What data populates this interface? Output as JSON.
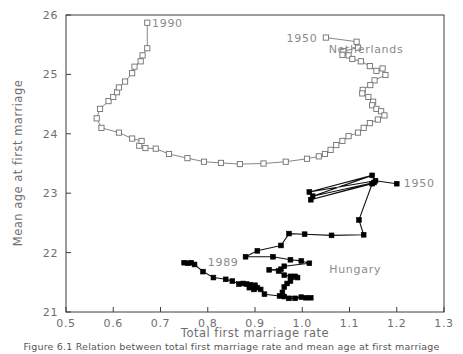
{
  "figure": {
    "caption": "Figure 6.1  Relation between total first marriage rate and mean age at first marriage"
  },
  "chart_data": {
    "type": "scatter",
    "title": "",
    "xlabel": "Total first marriage rate",
    "ylabel": "Mean age at first marriage",
    "xlim": [
      0.5,
      1.3
    ],
    "ylim": [
      21,
      26
    ],
    "xticks": [
      0.5,
      0.6,
      0.7,
      0.8,
      0.9,
      1.0,
      1.1,
      1.2,
      1.3
    ],
    "xtick_labels": [
      "0.5",
      "0.6",
      "0.7",
      "0.8",
      "0.9",
      "1.0",
      "1.1",
      "1.2",
      "1.3"
    ],
    "yticks": [
      21,
      22,
      23,
      24,
      25,
      26
    ],
    "ytick_labels": [
      "21",
      "22",
      "23",
      "24",
      "25",
      "26"
    ],
    "grid": false,
    "legend": "none",
    "connected": true,
    "annotations": [
      {
        "text": "1990",
        "x": 0.682,
        "y": 25.87,
        "anchor": "start",
        "series": "Netherlands"
      },
      {
        "text": "1950",
        "x": 1.032,
        "y": 25.62,
        "anchor": "end",
        "series": "Netherlands"
      },
      {
        "text": "Netherlands",
        "x": 1.135,
        "y": 25.42,
        "anchor": "middle",
        "series": "Netherlands"
      },
      {
        "text": "1950",
        "x": 1.215,
        "y": 23.18,
        "anchor": "start",
        "series": "Hungary"
      },
      {
        "text": "1989",
        "x": 0.8,
        "y": 21.84,
        "anchor": "start",
        "series": "Hungary"
      },
      {
        "text": "Hungary",
        "x": 1.112,
        "y": 21.73,
        "anchor": "middle",
        "series": "Hungary"
      }
    ],
    "series": [
      {
        "name": "Netherlands",
        "marker": "open-square",
        "color": "#6f6f6f",
        "start_label": "1950",
        "end_label": "1990",
        "points": [
          [
            1.05,
            25.62
          ],
          [
            1.115,
            25.55
          ],
          [
            1.118,
            25.45
          ],
          [
            1.087,
            25.39
          ],
          [
            1.085,
            25.33
          ],
          [
            1.098,
            25.32
          ],
          [
            1.106,
            25.26
          ],
          [
            1.124,
            25.22
          ],
          [
            1.143,
            25.14
          ],
          [
            1.157,
            25.06
          ],
          [
            1.17,
            25.1
          ],
          [
            1.176,
            24.99
          ],
          [
            1.153,
            24.9
          ],
          [
            1.144,
            24.82
          ],
          [
            1.128,
            24.74
          ],
          [
            1.127,
            24.68
          ],
          [
            1.14,
            24.62
          ],
          [
            1.15,
            24.54
          ],
          [
            1.148,
            24.48
          ],
          [
            1.157,
            24.42
          ],
          [
            1.167,
            24.38
          ],
          [
            1.174,
            24.31
          ],
          [
            1.16,
            24.24
          ],
          [
            1.143,
            24.18
          ],
          [
            1.13,
            24.1
          ],
          [
            1.118,
            24.02
          ],
          [
            1.098,
            23.96
          ],
          [
            1.085,
            23.88
          ],
          [
            1.072,
            23.81
          ],
          [
            1.06,
            23.73
          ],
          [
            1.048,
            23.66
          ],
          [
            1.035,
            23.62
          ],
          [
            1.01,
            23.58
          ],
          [
            0.965,
            23.53
          ],
          [
            0.918,
            23.5
          ],
          [
            0.868,
            23.49
          ],
          [
            0.828,
            23.51
          ],
          [
            0.792,
            23.53
          ],
          [
            0.757,
            23.59
          ],
          [
            0.718,
            23.66
          ],
          [
            0.69,
            23.75
          ],
          [
            0.668,
            23.76
          ],
          [
            0.655,
            23.8
          ],
          [
            0.66,
            23.88
          ],
          [
            0.64,
            23.92
          ],
          [
            0.612,
            24.02
          ],
          [
            0.575,
            24.1
          ],
          [
            0.565,
            24.26
          ],
          [
            0.572,
            24.42
          ],
          [
            0.59,
            24.55
          ],
          [
            0.6,
            24.62
          ],
          [
            0.608,
            24.7
          ],
          [
            0.612,
            24.78
          ],
          [
            0.625,
            24.88
          ],
          [
            0.64,
            25.02
          ],
          [
            0.645,
            25.13
          ],
          [
            0.658,
            25.22
          ],
          [
            0.662,
            25.32
          ],
          [
            0.672,
            25.44
          ],
          [
            0.672,
            25.87
          ]
        ]
      },
      {
        "name": "Hungary",
        "marker": "filled-square",
        "color": "#000000",
        "start_label": "1950",
        "end_label": "1989",
        "points": [
          [
            1.2,
            23.16
          ],
          [
            1.155,
            23.21
          ],
          [
            1.015,
            23.02
          ],
          [
            1.148,
            23.3
          ],
          [
            1.022,
            22.95
          ],
          [
            1.152,
            23.18
          ],
          [
            1.018,
            22.89
          ],
          [
            1.148,
            23.16
          ],
          [
            1.12,
            22.55
          ],
          [
            1.13,
            22.3
          ],
          [
            1.062,
            22.29
          ],
          [
            1.005,
            22.31
          ],
          [
            0.972,
            22.32
          ],
          [
            0.955,
            22.12
          ],
          [
            0.905,
            22.03
          ],
          [
            0.88,
            21.93
          ],
          [
            0.938,
            21.93
          ],
          [
            0.975,
            21.88
          ],
          [
            0.998,
            21.86
          ],
          [
            1.015,
            21.82
          ],
          [
            0.962,
            21.77
          ],
          [
            0.955,
            21.72
          ],
          [
            0.93,
            21.71
          ],
          [
            0.95,
            21.69
          ],
          [
            0.962,
            21.62
          ],
          [
            0.975,
            21.6
          ],
          [
            0.985,
            21.6
          ],
          [
            0.99,
            21.58
          ],
          [
            0.975,
            21.52
          ],
          [
            0.968,
            21.48
          ],
          [
            0.962,
            21.42
          ],
          [
            0.958,
            21.33
          ],
          [
            0.962,
            21.26
          ],
          [
            0.972,
            21.23
          ],
          [
            0.985,
            21.23
          ],
          [
            0.998,
            21.25
          ],
          [
            1.008,
            21.24
          ],
          [
            1.018,
            21.24
          ],
          [
            0.952,
            21.27
          ],
          [
            0.92,
            21.3
          ],
          [
            0.912,
            21.38
          ],
          [
            0.905,
            21.41
          ],
          [
            0.898,
            21.38
          ],
          [
            0.888,
            21.41
          ],
          [
            0.9,
            21.45
          ],
          [
            0.89,
            21.46
          ],
          [
            0.882,
            21.47
          ],
          [
            0.875,
            21.48
          ],
          [
            0.866,
            21.47
          ],
          [
            0.852,
            21.52
          ],
          [
            0.838,
            21.55
          ],
          [
            0.812,
            21.58
          ],
          [
            0.79,
            21.68
          ],
          [
            0.772,
            21.8
          ],
          [
            0.765,
            21.83
          ],
          [
            0.758,
            21.82
          ],
          [
            0.75,
            21.83
          ]
        ]
      }
    ]
  }
}
